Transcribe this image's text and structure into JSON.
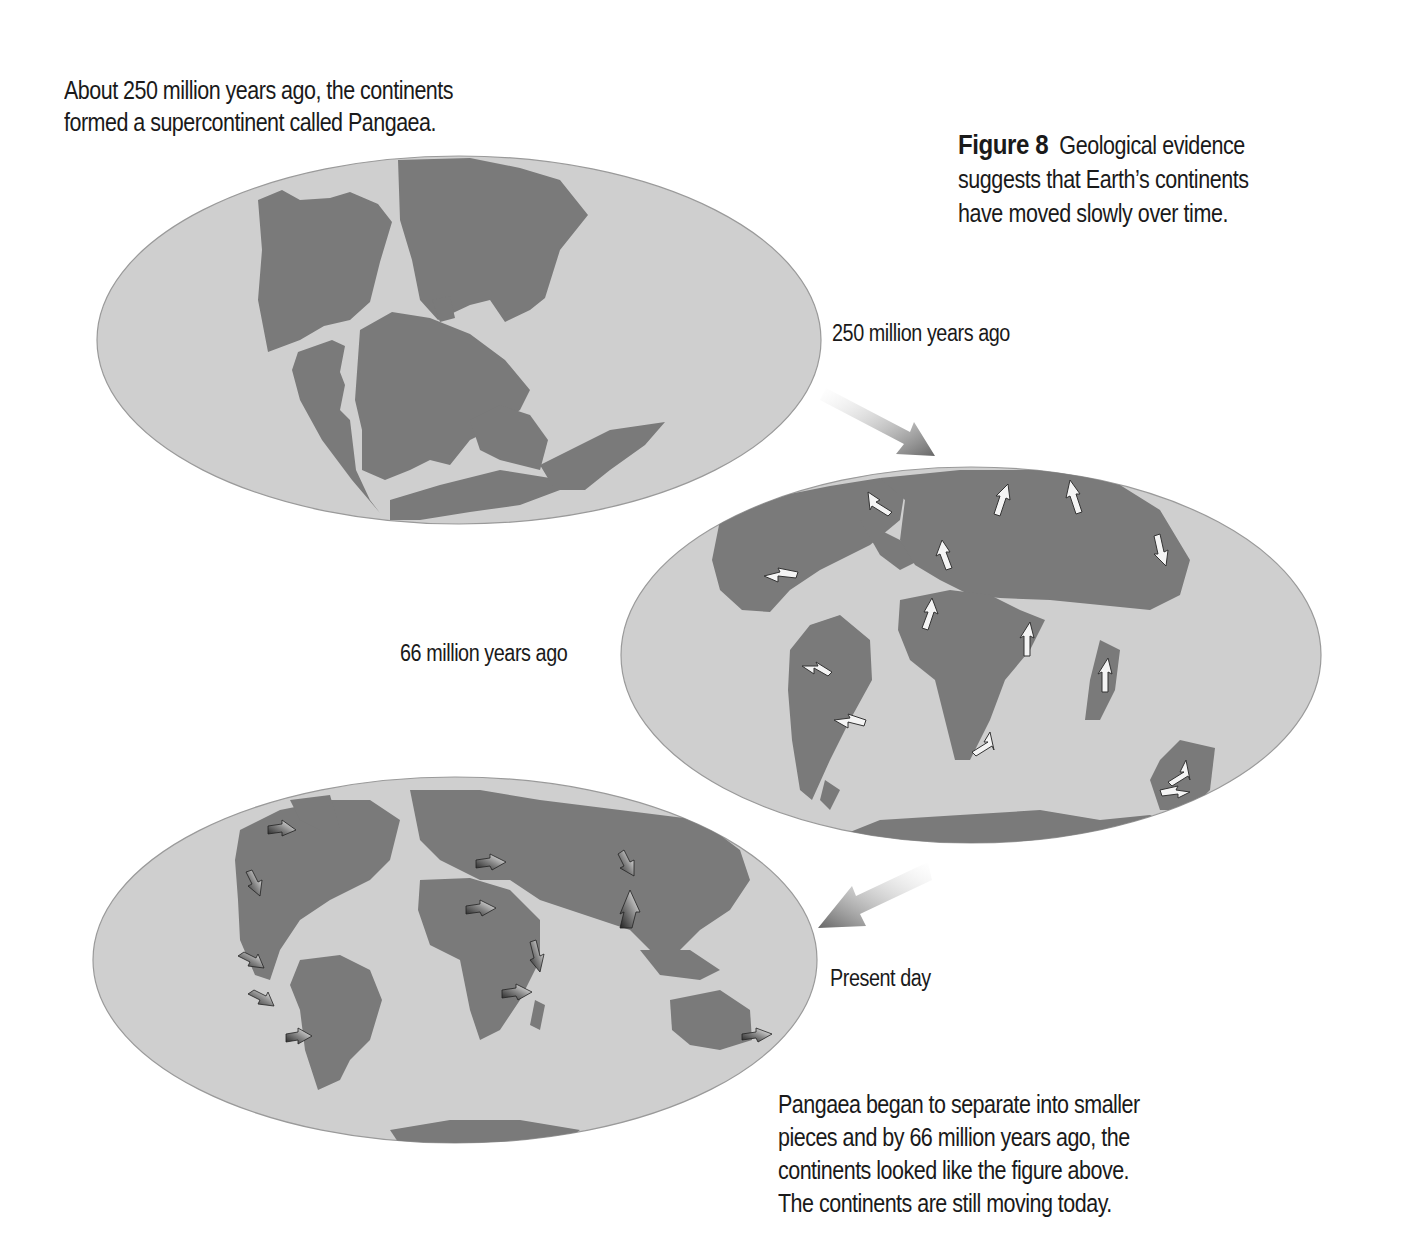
{
  "intro_text": [
    "About 250 million years ago, the continents",
    "formed a supercontinent called Pangaea."
  ],
  "caption": {
    "figure_label": "Figure 8",
    "lines": [
      "Geological evidence",
      "suggests that Earth’s continents",
      "have moved slowly over time."
    ]
  },
  "maps": [
    {
      "id": "pangaea",
      "label": "250 million years ago",
      "has_motion_arrows": false
    },
    {
      "id": "cretaceous",
      "label": "66 million years ago",
      "has_motion_arrows": true
    },
    {
      "id": "present",
      "label": "Present day",
      "has_motion_arrows": true
    }
  ],
  "closing_text": [
    "Pangaea began to separate into smaller",
    "pieces and by 66 million years ago, the",
    "continents looked like the figure above.",
    "The continents are still moving today."
  ],
  "colors": {
    "ocean": "#cfcfcf",
    "land": "#7a7a7a",
    "arrow": "#6d6d6d",
    "text": "#1a1a1a"
  }
}
